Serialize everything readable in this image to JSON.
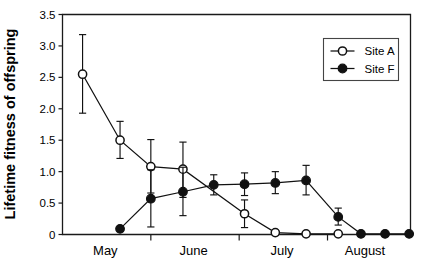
{
  "chart_data": {
    "type": "line",
    "title": "",
    "xlabel": "",
    "ylabel": "Lifetime fitness of offspring",
    "ylim": [
      0,
      3.5
    ],
    "yticks": [
      "0",
      "0.5",
      "1.0",
      "1.5",
      "2.0",
      "2.5",
      "3.0",
      "3.5"
    ],
    "ytick_values": [
      0,
      0.5,
      1.0,
      1.5,
      2.0,
      2.5,
      3.0,
      3.5
    ],
    "xlim": [
      0,
      13
    ],
    "xtick_labels": [
      "May",
      "June",
      "July",
      "August"
    ],
    "xtick_positions": [
      1.6,
      4.9,
      8.2,
      11.3
    ],
    "x_boundary_ticks": [
      3.3,
      6.6,
      9.9
    ],
    "grid": false,
    "legend_position": "top-right",
    "series": [
      {
        "name": "Site A",
        "marker": "open-circle",
        "points": [
          {
            "x": 0.75,
            "y": 2.55,
            "err_low": 0.62,
            "err_high": 0.63
          },
          {
            "x": 2.15,
            "y": 1.5,
            "err_low": 0.29,
            "err_high": 0.3
          },
          {
            "x": 3.3,
            "y": 1.08,
            "err_low": 0.42,
            "err_high": 0.43
          },
          {
            "x": 4.5,
            "y": 1.04,
            "err_low": 0.45,
            "err_high": 0.43
          },
          {
            "x": 6.8,
            "y": 0.33,
            "err_low": 0.22,
            "err_high": 0.22
          },
          {
            "x": 7.95,
            "y": 0.03,
            "err_low": 0.0,
            "err_high": 0.0
          },
          {
            "x": 9.1,
            "y": 0.01,
            "err_low": 0.0,
            "err_high": 0.0
          },
          {
            "x": 10.3,
            "y": 0.01,
            "err_low": 0.0,
            "err_high": 0.0
          }
        ]
      },
      {
        "name": "Site F",
        "marker": "filled-circle",
        "points": [
          {
            "x": 2.15,
            "y": 0.09,
            "err_low": 0.0,
            "err_high": 0.0
          },
          {
            "x": 3.3,
            "y": 0.57,
            "err_low": 0.45,
            "err_high": 0.46
          },
          {
            "x": 4.5,
            "y": 0.68,
            "err_low": 0.38,
            "err_high": 0.39
          },
          {
            "x": 5.65,
            "y": 0.79,
            "err_low": 0.16,
            "err_high": 0.16
          },
          {
            "x": 6.8,
            "y": 0.8,
            "err_low": 0.18,
            "err_high": 0.18
          },
          {
            "x": 7.95,
            "y": 0.82,
            "err_low": 0.17,
            "err_high": 0.18
          },
          {
            "x": 9.1,
            "y": 0.86,
            "err_low": 0.23,
            "err_high": 0.24
          },
          {
            "x": 10.3,
            "y": 0.28,
            "err_low": 0.13,
            "err_high": 0.14
          },
          {
            "x": 11.15,
            "y": 0.01,
            "err_low": 0.0,
            "err_high": 0.0
          },
          {
            "x": 12.05,
            "y": 0.01,
            "err_low": 0.0,
            "err_high": 0.0
          },
          {
            "x": 12.95,
            "y": 0.01,
            "err_low": 0.0,
            "err_high": 0.0
          }
        ]
      }
    ],
    "legend": [
      {
        "label": "Site A",
        "marker": "open-circle"
      },
      {
        "label": "Site F",
        "marker": "filled-circle"
      }
    ]
  }
}
